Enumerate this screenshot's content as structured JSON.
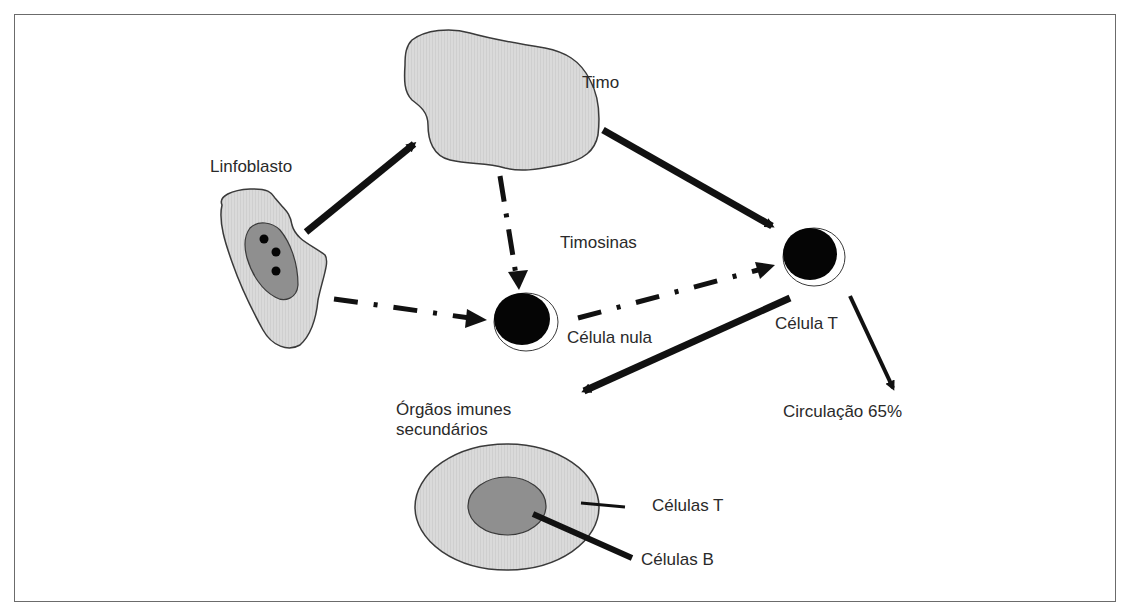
{
  "diagram": {
    "title": "",
    "colors": {
      "light_fill": "#d9d9d9",
      "dark_fill": "#8f8f8f",
      "outline": "#3a3a3a",
      "arrow": "#111111",
      "cell": "#050505"
    },
    "nodes": [
      {
        "id": "linfoblasto",
        "label": "Linfoblasto",
        "shape": "irregular-blob-with-nucleus"
      },
      {
        "id": "timo",
        "label": "Timo",
        "shape": "irregular-blob"
      },
      {
        "id": "timosinas",
        "label": "Timosinas",
        "shape": "text"
      },
      {
        "id": "celula_nula",
        "label": "Célula nula",
        "shape": "black-cell"
      },
      {
        "id": "celula_t",
        "label": "Célula T",
        "shape": "black-cell"
      },
      {
        "id": "circulacao",
        "label": "Circulação 65%",
        "shape": "text"
      },
      {
        "id": "orgaos",
        "label_line1": "Órgãos imunes",
        "label_line2": "secundários",
        "shape": "ellipse"
      },
      {
        "id": "celulas_t",
        "label": "Células T",
        "shape": "callout"
      },
      {
        "id": "celulas_b",
        "label": "Células B",
        "shape": "callout"
      }
    ],
    "edges": [
      {
        "from": "linfoblasto",
        "to": "timo",
        "style": "solid"
      },
      {
        "from": "timo",
        "to": "celula_t",
        "style": "solid"
      },
      {
        "from": "timo",
        "to": "celula_nula",
        "style": "dash-dot",
        "label": "Timosinas"
      },
      {
        "from": "linfoblasto",
        "to": "celula_nula",
        "style": "dash-dot"
      },
      {
        "from": "celula_nula",
        "to": "celula_t",
        "style": "dash-dot"
      },
      {
        "from": "celula_t",
        "to": "orgaos",
        "style": "solid"
      },
      {
        "from": "celula_t",
        "to": "circulacao",
        "style": "solid-thin"
      }
    ]
  }
}
